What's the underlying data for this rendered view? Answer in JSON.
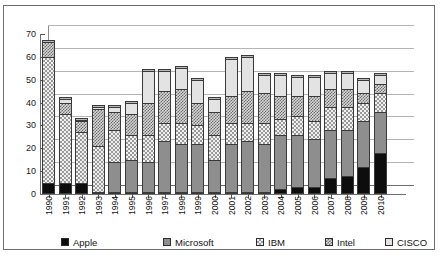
{
  "chart_data": {
    "type": "bar",
    "subtype": "stacked-column-3d",
    "title": "",
    "xlabel": "",
    "ylabel": "",
    "ylim": [
      0,
      70
    ],
    "ytick_step": 10,
    "yticks": [
      0,
      10,
      20,
      30,
      40,
      50,
      60,
      70
    ],
    "grid": true,
    "legend_position": "bottom",
    "categories": [
      "1990",
      "1991",
      "1992",
      "1993",
      "1994",
      "1995",
      "1996",
      "1997",
      "1998",
      "1999",
      "2000",
      "2001",
      "2002",
      "2003",
      "2004",
      "2005",
      "2006",
      "2007",
      "2008",
      "2009",
      "2010"
    ],
    "series": [
      {
        "name": "Apple",
        "color": "#0d0d0d",
        "values": [
          5,
          5,
          5,
          1,
          1,
          1,
          1,
          1,
          1,
          1,
          1,
          1,
          1,
          1,
          2,
          3,
          3,
          7,
          8,
          12,
          18
        ]
      },
      {
        "name": "Microsoft",
        "color": "#8e8e8e",
        "values": [
          0,
          0,
          0,
          0,
          13,
          14,
          13,
          22,
          21,
          21,
          14,
          21,
          22,
          21,
          24,
          23,
          21,
          21,
          20,
          20,
          18
        ]
      },
      {
        "name": "IBM",
        "color": "#f0f0f0",
        "values": [
          55,
          30,
          22,
          20,
          14,
          11,
          12,
          8,
          9,
          8,
          11,
          9,
          8,
          9,
          7,
          8,
          8,
          10,
          10,
          8,
          8
        ]
      },
      {
        "name": "Intel",
        "color": "#d5d5d5",
        "values": [
          6.5,
          5,
          5,
          16,
          8,
          9,
          14,
          14,
          15,
          10,
          10,
          12,
          14,
          13,
          10,
          9,
          11,
          8,
          8,
          4,
          4
        ]
      },
      {
        "name": "CISCO",
        "color": "#e3e3e3",
        "values": [
          0,
          1.5,
          0.5,
          1,
          2,
          5,
          14,
          9,
          9,
          10,
          5.5,
          16,
          15,
          8,
          9,
          8,
          8,
          7,
          7,
          6,
          4
        ]
      }
    ],
    "totals": [
      66.5,
      41.5,
      32.5,
      38,
      38,
      40,
      54,
      54,
      55,
      50,
      41.5,
      59,
      60,
      52,
      52,
      51,
      51,
      53,
      53,
      50,
      52
    ]
  },
  "legend": {
    "items": [
      {
        "label": "Apple",
        "swatch": "apple-swatch"
      },
      {
        "label": "Microsoft",
        "swatch": "microsoft-swatch"
      },
      {
        "label": "IBM",
        "swatch": "ibm-swatch"
      },
      {
        "label": "Intel",
        "swatch": "intel-swatch"
      },
      {
        "label": "CISCO",
        "swatch": "cisco-swatch"
      }
    ]
  }
}
